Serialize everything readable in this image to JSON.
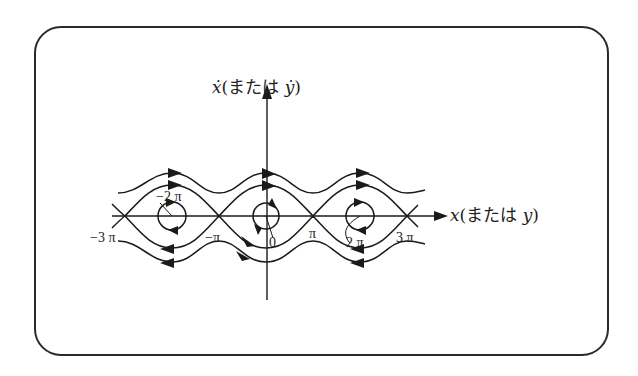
{
  "diagram": {
    "y_axis_label": "ẋ(または ẏ)",
    "y_axis_label_parts": {
      "var": "ẋ",
      "paren_open": "(",
      "jp": "または",
      "var2": "ẏ",
      "paren_close": ")"
    },
    "x_axis_label": "x(または y)",
    "x_axis_label_parts": {
      "var": "x",
      "paren_open": "(",
      "jp": "または",
      "var2": "y",
      "paren_close": ")"
    },
    "tick_labels": [
      "−3 π",
      "−2 π",
      "−π",
      "0",
      "π",
      "2 π",
      "3 π"
    ],
    "tick_positions_px": [
      125,
      172,
      219,
      266,
      313,
      360,
      407
    ],
    "centers": [
      "−2π",
      "0",
      "2π"
    ],
    "saddles": [
      "−3π",
      "−π",
      "π",
      "3π"
    ],
    "flow": {
      "upper_curves_direction": "right",
      "lower_curves_direction": "left",
      "center_orbits": "clockwise"
    },
    "colors": {
      "stroke": "#1a1a1a",
      "frame": "#2a2a2a",
      "background": "#ffffff"
    }
  }
}
